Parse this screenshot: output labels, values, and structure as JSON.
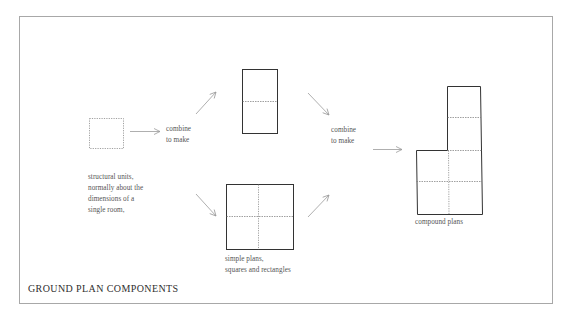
{
  "figure": {
    "title": "GROUND PLAN COMPONENTS",
    "steps": {
      "units": {
        "label": "structural units,\nnormally about the\ndimensions of a\nsingle room,",
        "icon": "dotted-unit-square"
      },
      "combine_1": {
        "label": "combine\nto make"
      },
      "simple_plans": {
        "label": "simple plans,\nsquares and rectangles",
        "shapes": [
          "tall-rectangle-two-units",
          "square-four-units"
        ]
      },
      "combine_2": {
        "label": "combine\nto make"
      },
      "compound_plans": {
        "label": "compound plans",
        "icon": "l-shaped-plan"
      }
    },
    "arrows": [
      "right",
      "up-right",
      "down-right",
      "down-right",
      "up-right",
      "right"
    ],
    "colors": {
      "frame": "#a8a8a8",
      "outline": "#333333",
      "dashed": "#777777",
      "arrow": "#9a9a9a",
      "text": "#555555",
      "title": "#2e2e2e"
    }
  }
}
